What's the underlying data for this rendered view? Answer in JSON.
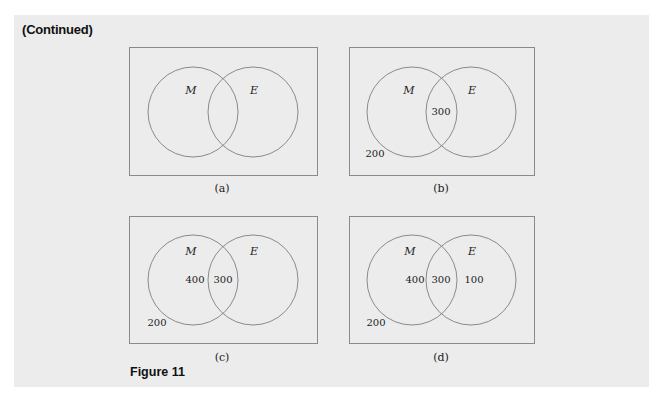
{
  "header": {
    "continued_label": "(Continued)"
  },
  "figure": {
    "label": "Figure 11"
  },
  "panels": [
    {
      "caption": "(a)",
      "set_left": "M",
      "set_right": "E",
      "only_m": "",
      "both": "",
      "only_e": "",
      "neither": ""
    },
    {
      "caption": "(b)",
      "set_left": "M",
      "set_right": "E",
      "only_m": "",
      "both": "300",
      "only_e": "",
      "neither": "200"
    },
    {
      "caption": "(c)",
      "set_left": "M",
      "set_right": "E",
      "only_m": "400",
      "both": "300",
      "only_e": "",
      "neither": "200"
    },
    {
      "caption": "(d)",
      "set_left": "M",
      "set_right": "E",
      "only_m": "400",
      "both": "300",
      "only_e": "100",
      "neither": "200"
    }
  ],
  "colors": {
    "panel_background": "#ececec",
    "line": "#8a8a8a",
    "text": "#222222"
  }
}
